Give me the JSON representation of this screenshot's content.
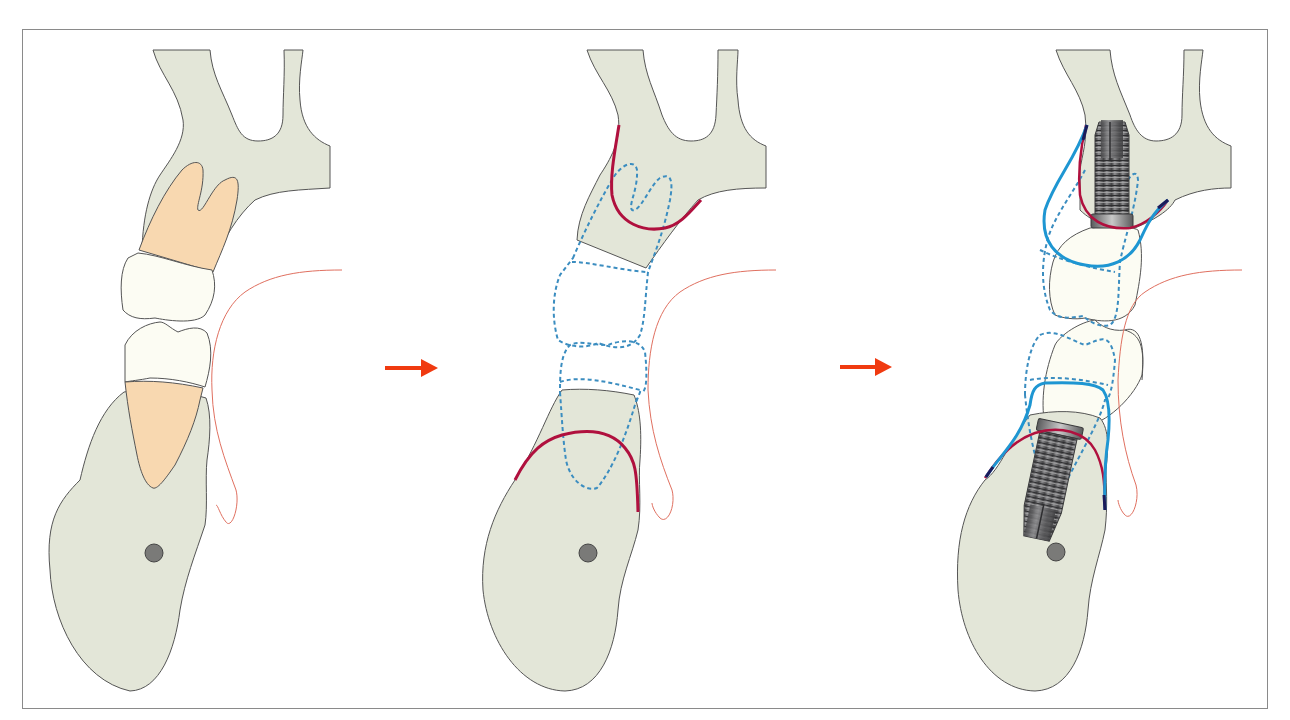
{
  "figure": {
    "panels": [
      {
        "id": "panel-1",
        "label": "Natural dentition",
        "elements": [
          "maxilla",
          "mandible",
          "upper-tooth-root",
          "upper-crown",
          "lower-crown",
          "lower-tooth-root",
          "lip-line",
          "mandibular-canal"
        ]
      },
      {
        "id": "panel-2",
        "label": "After extraction with original tooth outline (dashed) and bone contour (red)",
        "elements": [
          "maxilla",
          "mandible",
          "dashed-tooth-outlines",
          "bone-contour-lines",
          "lip-line",
          "mandibular-canal"
        ]
      },
      {
        "id": "panel-3",
        "label": "Implants with prosthetic crowns",
        "elements": [
          "maxilla",
          "mandible",
          "upper-implant",
          "lower-implant",
          "prosthetic-crowns",
          "soft-tissue-contour-blue",
          "bone-contour-red",
          "dashed-tooth-outlines",
          "lip-line",
          "mandibular-canal"
        ]
      }
    ],
    "arrows": [
      {
        "id": "arrow-1",
        "from": "panel-1",
        "to": "panel-2",
        "direction": "right"
      },
      {
        "id": "arrow-2",
        "from": "panel-2",
        "to": "panel-3",
        "direction": "right"
      }
    ],
    "colors": {
      "bone": "#E3E6D8",
      "root": "#F8D8B0",
      "crown": "#FCFCF3",
      "outline": "#555555",
      "bone_contour_red": "#B0103E",
      "soft_tissue_blue": "#1E96D2",
      "dashed_outline": "#3B8DC0",
      "lip_line": "#E07060",
      "arrow": "#F03A10",
      "canal": "#7A7A78",
      "implant": "#6A6A6C",
      "frame": "#8A8A8A"
    }
  }
}
